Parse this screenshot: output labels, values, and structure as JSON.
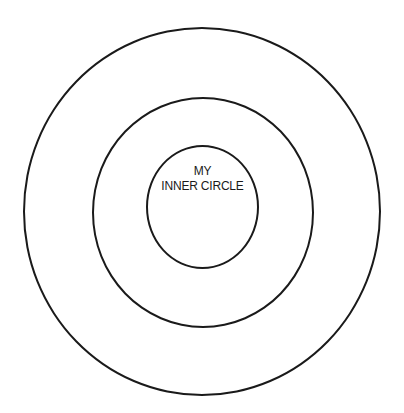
{
  "diagram": {
    "type": "concentric-circles",
    "rings": [
      {
        "id": "outer",
        "label": ""
      },
      {
        "id": "middle",
        "label": ""
      },
      {
        "id": "inner",
        "label_lines": [
          "MY",
          "INNER CIRCLE"
        ]
      }
    ],
    "colors": {
      "stroke": "#1a1a1a",
      "background": "#ffffff"
    }
  }
}
